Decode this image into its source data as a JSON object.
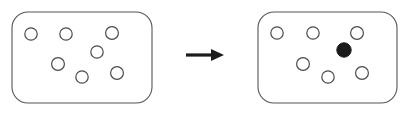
{
  "figure": {
    "title": "",
    "canvas": {
      "width": 412,
      "height": 117,
      "background": "#ffffff"
    },
    "colors": {
      "box_stroke": "#555555",
      "box_fill": "#ffffff",
      "circle_open_stroke": "#4a4a4a",
      "circle_open_fill": "#ffffff",
      "circle_filled_fill": "#1a1a1a",
      "arrow_fill": "#1c1c1c"
    },
    "panels": [
      {
        "id": "before",
        "label": "",
        "box": {
          "x": 12,
          "y": 12,
          "width": 140,
          "height": 91,
          "corner_radius": 16
        },
        "open_circle_count": 7,
        "filled_circle_count": 0,
        "circles": [
          {
            "id": "c1",
            "cx": 31,
            "cy": 34,
            "r": 6.2,
            "state": "open"
          },
          {
            "id": "c2",
            "cx": 66,
            "cy": 34,
            "r": 6.2,
            "state": "open"
          },
          {
            "id": "c3",
            "cx": 112,
            "cy": 33,
            "r": 6.4,
            "state": "open"
          },
          {
            "id": "c4",
            "cx": 97,
            "cy": 52,
            "r": 6.2,
            "state": "open"
          },
          {
            "id": "c5",
            "cx": 58,
            "cy": 64,
            "r": 6.4,
            "state": "open"
          },
          {
            "id": "c6",
            "cx": 82,
            "cy": 77,
            "r": 6.2,
            "state": "open"
          },
          {
            "id": "c7",
            "cx": 117,
            "cy": 73,
            "r": 6.4,
            "state": "open"
          }
        ]
      },
      {
        "id": "after",
        "label": "",
        "box": {
          "x": 258,
          "y": 12,
          "width": 139,
          "height": 91,
          "corner_radius": 16
        },
        "open_circle_count": 6,
        "filled_circle_count": 1,
        "circles": [
          {
            "id": "d1",
            "cx": 277,
            "cy": 33,
            "r": 6.2,
            "state": "open"
          },
          {
            "id": "d2",
            "cx": 313,
            "cy": 33,
            "r": 6.2,
            "state": "open"
          },
          {
            "id": "d3",
            "cx": 357,
            "cy": 33,
            "r": 6.4,
            "state": "open"
          },
          {
            "id": "d4",
            "cx": 344,
            "cy": 50,
            "r": 7.2,
            "state": "filled"
          },
          {
            "id": "d5",
            "cx": 303,
            "cy": 64,
            "r": 6.4,
            "state": "open"
          },
          {
            "id": "d6",
            "cx": 328,
            "cy": 77,
            "r": 6.2,
            "state": "open"
          },
          {
            "id": "d7",
            "cx": 362,
            "cy": 73,
            "r": 6.4,
            "state": "open"
          }
        ]
      }
    ],
    "arrow": {
      "name": "transition-arrow",
      "direction": "right",
      "shaft": {
        "x": 186,
        "y": 53.5,
        "width": 28,
        "height": 3.2
      },
      "head": {
        "tip_x": 224,
        "base_x": 211,
        "cy": 55,
        "half_height": 6
      }
    }
  }
}
